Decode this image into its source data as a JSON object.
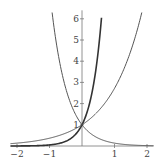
{
  "chart_data": {
    "type": "line",
    "title": "",
    "xlabel": "",
    "ylabel": "",
    "xlim": [
      -2.2,
      2.2
    ],
    "ylim": [
      0,
      6.4
    ],
    "x_ticks": [
      -2,
      -1,
      1,
      2
    ],
    "x_tick_labels": [
      "−2",
      "−1",
      "1",
      "2"
    ],
    "y_ticks": [
      1,
      2,
      3,
      4,
      5,
      6
    ],
    "y_tick_labels": [
      "1",
      "2",
      "3",
      "4",
      "5",
      "6"
    ],
    "grid": false,
    "legend": null,
    "series": [
      {
        "name": "e^(-2x)",
        "x": [
          -0.93,
          -0.75,
          -0.5,
          -0.25,
          0,
          0.5,
          1,
          1.5,
          2,
          2.2
        ],
        "y": [
          6.4,
          4.48,
          2.72,
          1.65,
          1,
          0.37,
          0.14,
          0.05,
          0.02,
          0.01
        ],
        "color": "#555555"
      },
      {
        "name": "e^(3x)",
        "x": [
          -2.2,
          -1.5,
          -1,
          -0.5,
          0,
          0.25,
          0.5,
          0.62
        ],
        "y": [
          0.0,
          0.01,
          0.05,
          0.22,
          1,
          2.12,
          4.48,
          6.4
        ],
        "color": "#333333"
      },
      {
        "name": "e^x",
        "x": [
          -2.2,
          -2,
          -1,
          0,
          0.5,
          1,
          1.5,
          1.86
        ],
        "y": [
          0.11,
          0.14,
          0.37,
          1,
          1.65,
          2.72,
          4.48,
          6.4
        ],
        "color": "#555555"
      }
    ]
  }
}
